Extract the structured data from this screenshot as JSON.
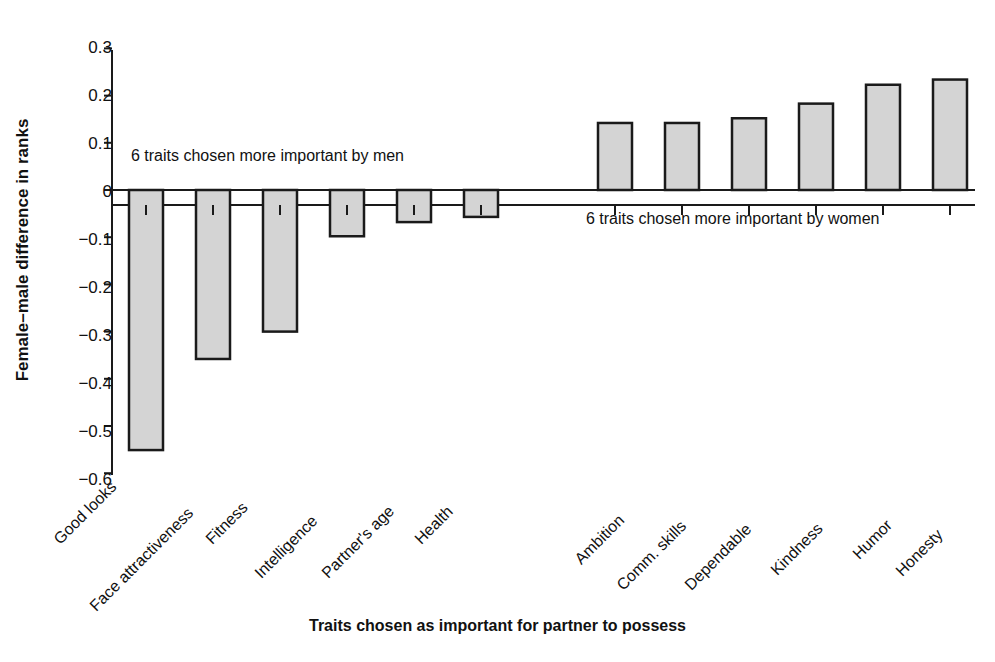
{
  "chart_data": {
    "type": "bar",
    "title": "",
    "xlabel": "Traits chosen as important for partner to possess",
    "ylabel": "Female–male difference in ranks",
    "ylim": [
      -0.6,
      0.3
    ],
    "yticks": [
      0.3,
      0.2,
      0.1,
      0,
      -0.1,
      -0.2,
      -0.3,
      -0.4,
      -0.5,
      -0.6
    ],
    "ytick_labels": [
      "0.3",
      "0.2",
      "0.1",
      "0",
      "−0.1",
      "−0.2",
      "−0.3",
      "−0.4",
      "−0.5",
      "−0.6"
    ],
    "grid": false,
    "legend": false,
    "bar_fill": "#d4d4d4",
    "bar_edge": "#1a1a1a",
    "axis_color": "#1a1a1a",
    "categories": [
      "Good looks",
      "Face attractiveness",
      "Fitness",
      "Intelligence",
      "Partner's age",
      "Health",
      "Ambition",
      "Comm. skills",
      "Dependable",
      "Kindness",
      "Humor",
      "Honesty"
    ],
    "values": [
      -0.551,
      -0.358,
      -0.3,
      -0.098,
      -0.068,
      -0.057,
      0.142,
      0.142,
      0.152,
      0.183,
      0.223,
      0.234
    ],
    "annotations": [
      {
        "text": "6 traits chosen more important by men",
        "x_frac": 0.05,
        "y_value": 0.055
      },
      {
        "text": "6 traits chosen more important by women",
        "x_frac": 0.59,
        "y_value": -0.09
      }
    ]
  },
  "axis": {
    "ytick_0": "0.3",
    "ytick_1": "0.2",
    "ytick_2": "0.1",
    "ytick_3": "0",
    "ytick_4": "−0.1",
    "ytick_5": "−0.2",
    "ytick_6": "−0.3",
    "ytick_7": "−0.4",
    "ytick_8": "−0.5",
    "ytick_9": "−0.6"
  },
  "labels": {
    "y_axis_title": "Female–male difference in ranks",
    "x_axis_title": "Traits chosen as important for partner to possess",
    "annotation_men": "6 traits chosen more important by men",
    "annotation_women": "6 traits chosen more important by women",
    "cat_0": "Good looks",
    "cat_1": "Face attractiveness",
    "cat_2": "Fitness",
    "cat_3": "Intelligence",
    "cat_4": "Partner's age",
    "cat_5": "Health",
    "cat_6": "Ambition",
    "cat_7": "Comm. skills",
    "cat_8": "Dependable",
    "cat_9": "Kindness",
    "cat_10": "Humor",
    "cat_11": "Honesty"
  }
}
